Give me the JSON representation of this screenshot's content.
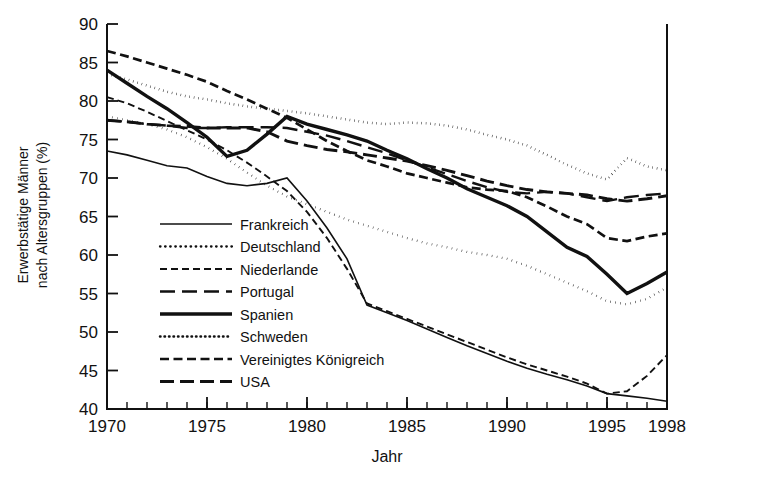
{
  "chart_data": {
    "type": "line",
    "title": "",
    "xlabel": "Jahr",
    "ylabel": "Erwerbstätige Männer nach Altersgruppen (%)",
    "ylabel_line1": "Erwerbstätige Männer",
    "ylabel_line2": "nach Altersgruppen (%)",
    "xlim": [
      1970,
      1998
    ],
    "ylim": [
      40,
      90
    ],
    "grid": false,
    "legend_position": "center-left-inside",
    "x_ticks_major": [
      1970,
      1975,
      1980,
      1985,
      1990,
      1995,
      1998
    ],
    "x_tick_labels": [
      "1970",
      "1975",
      "1980",
      "1985",
      "1990",
      "1995",
      "1998"
    ],
    "x_ticks_minor_step": 1,
    "y_ticks": [
      40,
      45,
      50,
      55,
      60,
      65,
      70,
      75,
      80,
      85,
      90
    ],
    "y_tick_labels": [
      "40",
      "45",
      "50",
      "55",
      "60",
      "65",
      "70",
      "75",
      "80",
      "85",
      "90"
    ],
    "x": [
      1970,
      1971,
      1972,
      1973,
      1974,
      1975,
      1976,
      1977,
      1978,
      1979,
      1980,
      1981,
      1982,
      1983,
      1984,
      1985,
      1986,
      1987,
      1988,
      1989,
      1990,
      1991,
      1992,
      1993,
      1994,
      1995,
      1996,
      1997,
      1998
    ],
    "series": [
      {
        "name": "Frankreich",
        "dash_style": "solid",
        "stroke_width": 1.6,
        "dasharray": "",
        "values": [
          73.5,
          73.0,
          72.3,
          71.6,
          71.3,
          70.2,
          69.3,
          69.0,
          69.3,
          70.0,
          67.0,
          63.5,
          59.5,
          53.5,
          52.5,
          51.5,
          50.4,
          49.3,
          48.2,
          47.2,
          46.2,
          45.3,
          44.5,
          43.8,
          43.0,
          42.0,
          41.7,
          41.4,
          41.0
        ]
      },
      {
        "name": "Deutschland",
        "dash_style": "dotted",
        "stroke_width": 2.3,
        "dasharray": "0.5 4.6",
        "values": [
          78.0,
          77.5,
          77.0,
          76.3,
          75.3,
          74.0,
          72.5,
          70.7,
          69.0,
          67.6,
          66.6,
          65.6,
          64.6,
          63.8,
          63.0,
          62.2,
          61.5,
          61.0,
          60.4,
          60.0,
          59.5,
          58.6,
          57.5,
          56.4,
          55.3,
          54.0,
          53.6,
          54.3,
          55.8
        ]
      },
      {
        "name": "Niederlande",
        "dash_style": "dashed-short",
        "stroke_width": 1.9,
        "dasharray": "7 4",
        "values": [
          80.5,
          79.7,
          78.6,
          77.4,
          76.2,
          75.0,
          73.6,
          72.0,
          70.2,
          68.3,
          65.6,
          62.2,
          58.2,
          53.7,
          52.7,
          51.7,
          50.7,
          49.7,
          48.7,
          47.7,
          46.7,
          45.8,
          45.0,
          44.2,
          43.3,
          42.0,
          42.3,
          44.3,
          47.0
        ]
      },
      {
        "name": "Portugal",
        "dash_style": "dashed-long",
        "stroke_width": 2.4,
        "dasharray": "15 7",
        "values": [
          77.5,
          77.3,
          77.0,
          76.8,
          76.5,
          76.5,
          76.6,
          76.6,
          76.6,
          76.5,
          76.0,
          75.5,
          74.8,
          74.0,
          73.2,
          72.3,
          71.4,
          70.5,
          69.6,
          68.8,
          68.2,
          68.0,
          68.2,
          68.0,
          67.5,
          67.0,
          67.5,
          67.8,
          68.0
        ]
      },
      {
        "name": "Spanien",
        "dash_style": "solid-thick",
        "stroke_width": 3.4,
        "dasharray": "",
        "values": [
          84.0,
          82.3,
          80.6,
          79.0,
          77.2,
          75.3,
          72.8,
          73.6,
          75.7,
          78.0,
          77.0,
          76.3,
          75.6,
          74.8,
          73.6,
          72.5,
          71.2,
          70.0,
          68.6,
          67.5,
          66.4,
          65.0,
          63.0,
          61.0,
          59.8,
          57.5,
          55.0,
          56.3,
          57.8
        ]
      },
      {
        "name": "Schweden",
        "dash_style": "fine-dotted",
        "stroke_width": 2.5,
        "dasharray": "0.5 4.0",
        "values": [
          83.5,
          82.8,
          82.0,
          81.2,
          80.6,
          80.2,
          79.7,
          79.3,
          79.0,
          78.7,
          78.4,
          78.0,
          77.6,
          77.2,
          77.0,
          77.2,
          77.1,
          76.8,
          76.3,
          75.6,
          75.0,
          74.2,
          73.0,
          71.7,
          70.6,
          69.8,
          72.6,
          71.5,
          71.0
        ]
      },
      {
        "name": "Vereinigtes Königreich",
        "dash_style": "dashed-medium",
        "stroke_width": 2.7,
        "dasharray": "9 4.5",
        "values": [
          86.5,
          85.8,
          85.0,
          84.2,
          83.4,
          82.5,
          81.3,
          80.2,
          79.0,
          77.8,
          76.3,
          74.8,
          73.5,
          72.3,
          71.5,
          70.6,
          70.0,
          69.4,
          68.8,
          68.5,
          68.3,
          67.5,
          66.3,
          65.0,
          64.0,
          62.2,
          61.8,
          62.4,
          62.8
        ]
      },
      {
        "name": "USA",
        "dash_style": "dash-long-thick",
        "stroke_width": 2.9,
        "dasharray": "14 6",
        "values": [
          77.5,
          77.3,
          77.0,
          76.8,
          76.7,
          76.5,
          76.5,
          76.5,
          76.0,
          74.8,
          74.2,
          73.7,
          73.4,
          73.0,
          72.6,
          72.2,
          71.6,
          71.0,
          70.3,
          69.6,
          69.0,
          68.5,
          68.2,
          68.0,
          67.8,
          67.3,
          67.0,
          67.3,
          67.7
        ]
      }
    ],
    "legend": [
      {
        "label": "Frankreich",
        "dasharray": "",
        "stroke_width": 1.6
      },
      {
        "label": "Deutschland",
        "dasharray": "0.5 4.6",
        "stroke_width": 2.3
      },
      {
        "label": "Niederlande",
        "dasharray": "7 4",
        "stroke_width": 1.9
      },
      {
        "label": "Portugal",
        "dasharray": "15 7",
        "stroke_width": 2.4
      },
      {
        "label": "Spanien",
        "dasharray": "",
        "stroke_width": 3.4
      },
      {
        "label": "Schweden",
        "dasharray": "0.5 4.0",
        "stroke_width": 2.5
      },
      {
        "label": "Vereinigtes Königreich",
        "dasharray": "9 4.5",
        "stroke_width": 2.7
      },
      {
        "label": "USA",
        "dasharray": "14 6",
        "stroke_width": 2.9
      }
    ],
    "colors": {
      "ink": "#111111",
      "background": "#ffffff"
    }
  }
}
